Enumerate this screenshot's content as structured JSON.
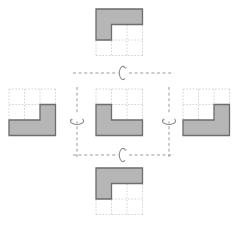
{
  "figure": {
    "type": "geometry-transformation-diagram",
    "layout": "cross",
    "canvas": {
      "width": 247,
      "height": 225
    },
    "grid": {
      "cols": 3,
      "rows": 3,
      "cell_px": 15.5,
      "style": "dashed",
      "color": "#c9c9c9"
    },
    "shape_fill": "#b6b6b6",
    "shape_stroke": "#6e6e6e",
    "axis_color": "#9a9a9a",
    "background": "#ffffff"
  },
  "shapes": [
    {
      "id": "top",
      "name": "shape-top",
      "position": {
        "x": 96,
        "y": 9
      },
      "grid_cells": [
        [
          0,
          0
        ],
        [
          1,
          0
        ],
        [
          2,
          0
        ],
        [
          0,
          1
        ]
      ],
      "description": "L rotated 180 degrees: top row filled plus left column upper cells",
      "polygon": "0,0 3,0 3,1 1,1 1,2 0,2"
    },
    {
      "id": "left",
      "name": "shape-left",
      "position": {
        "x": 9,
        "y": 89
      },
      "grid_cells": [
        [
          2,
          1
        ],
        [
          0,
          2
        ],
        [
          1,
          2
        ],
        [
          2,
          2
        ]
      ],
      "description": "Mirrored L: vertical arm on right, foot along bottom",
      "polygon": "2,1 3,1 3,3 0,3 0,2 2,2"
    },
    {
      "id": "center",
      "name": "shape-center",
      "position": {
        "x": 96,
        "y": 89
      },
      "grid_cells": [
        [
          0,
          1
        ],
        [
          0,
          2
        ],
        [
          1,
          2
        ],
        [
          2,
          2
        ]
      ],
      "description": "Original L: vertical arm on left, foot along bottom",
      "polygon": "0,1 1,1 1,2 3,2 3,3 0,3"
    },
    {
      "id": "right",
      "name": "shape-right",
      "position": {
        "x": 183,
        "y": 89
      },
      "grid_cells": [
        [
          2,
          1
        ],
        [
          0,
          2
        ],
        [
          1,
          2
        ],
        [
          2,
          2
        ]
      ],
      "description": "Mirrored L: vertical arm on right, foot along bottom",
      "polygon": "2,1 3,1 3,3 0,3 0,2 2,2"
    },
    {
      "id": "bottom",
      "name": "shape-bottom",
      "position": {
        "x": 96,
        "y": 168
      },
      "grid_cells": [
        [
          0,
          0
        ],
        [
          1,
          0
        ],
        [
          2,
          0
        ],
        [
          0,
          1
        ]
      ],
      "description": "L rotated 180 degrees: top row filled plus left column upper cells",
      "polygon": "0,0 3,0 3,1 1,1 1,2 0,2"
    }
  ],
  "axes": [
    {
      "id": "axis-top",
      "name": "horizontal-mirror-axis-top",
      "orientation": "horizontal",
      "position": {
        "x": 73,
        "y": 73,
        "length": 101
      },
      "icon": "rotation-loop-icon",
      "icon_position": {
        "x": 123,
        "y": 73
      },
      "meaning": "reflection across horizontal axis"
    },
    {
      "id": "axis-left",
      "name": "vertical-mirror-axis-left",
      "orientation": "vertical",
      "position": {
        "x": 77,
        "y": 87,
        "length": 70
      },
      "icon": "rotation-loop-icon",
      "icon_position": {
        "x": 77,
        "y": 117
      },
      "meaning": "reflection across vertical axis"
    },
    {
      "id": "axis-right",
      "name": "vertical-mirror-axis-right",
      "orientation": "vertical",
      "position": {
        "x": 169,
        "y": 87,
        "length": 70
      },
      "icon": "rotation-loop-icon",
      "icon_position": {
        "x": 169,
        "y": 117
      },
      "meaning": "reflection across vertical axis"
    },
    {
      "id": "axis-bottom",
      "name": "horizontal-mirror-axis-bottom",
      "orientation": "horizontal",
      "position": {
        "x": 73,
        "y": 155,
        "length": 101
      },
      "icon": "rotation-loop-icon",
      "icon_position": {
        "x": 123,
        "y": 155
      },
      "meaning": "reflection across horizontal axis"
    }
  ]
}
